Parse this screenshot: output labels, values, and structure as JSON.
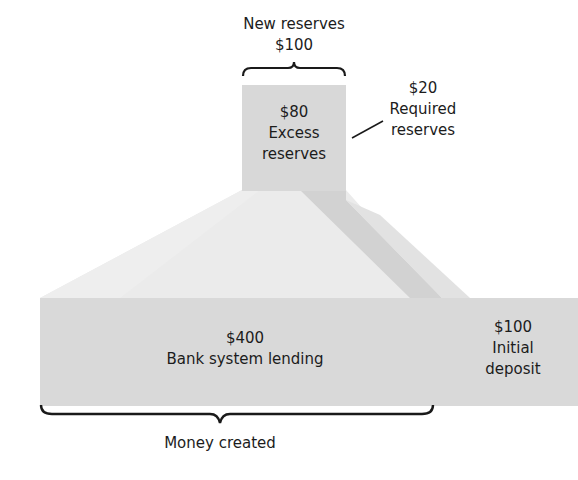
{
  "diagram": {
    "new_reserves": {
      "label": "New reserves",
      "amount": "$100"
    },
    "excess_reserves": {
      "amount": "$80",
      "line1": "Excess",
      "line2": "reserves"
    },
    "required_reserves": {
      "amount": "$20",
      "line1": "Required",
      "line2": "reserves"
    },
    "bank_lending": {
      "amount": "$400",
      "label": "Bank system lending"
    },
    "initial_deposit": {
      "amount": "$100",
      "line1": "Initial",
      "line2": "deposit"
    },
    "money_created": {
      "label": "Money created"
    },
    "colors": {
      "box_fill": "#d9d9d9",
      "funnel_light": "#ececec",
      "funnel_shadow": "#cfcfcf",
      "text": "#1c1c1c",
      "brace": "#1a1a1a"
    }
  }
}
